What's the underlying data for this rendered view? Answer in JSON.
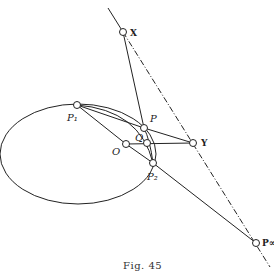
{
  "figure": {
    "caption": "Fig. 45",
    "labels": {
      "X": "X",
      "Y": "Y",
      "P": "P",
      "Q": "Q",
      "O": "O",
      "P1": "P₁",
      "P2": "P₂",
      "Pinf": "P∞"
    },
    "points": {
      "X": [
        123,
        32
      ],
      "Y": [
        193,
        143
      ],
      "P": [
        144,
        128
      ],
      "Q": [
        147,
        143
      ],
      "O": [
        126,
        144
      ],
      "P1": [
        77,
        105
      ],
      "P2": [
        153,
        163
      ],
      "Pinf": [
        256,
        243
      ]
    },
    "ellipse": {
      "cx": 78,
      "cy": 154,
      "rx": 78,
      "ry": 50
    },
    "stroke_color": "#222222"
  }
}
